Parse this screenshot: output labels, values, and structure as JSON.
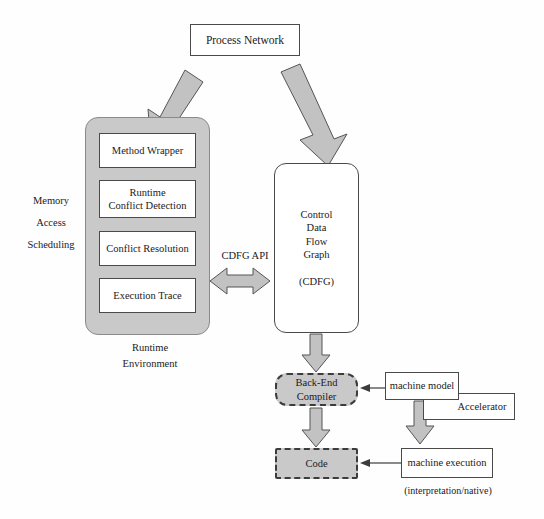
{
  "diagram": {
    "title_node": {
      "label": "Process Network"
    },
    "runtime": {
      "caption_line1": "Runtime",
      "caption_line2": "Environment",
      "side_labels": [
        "Memory",
        "Access",
        "Scheduling"
      ],
      "components": [
        {
          "label": "Method Wrapper"
        },
        {
          "label_line1": "Runtime",
          "label_line2": "Conflict Detection"
        },
        {
          "label": "Conflict Resolution"
        },
        {
          "label": "Execution Trace"
        }
      ]
    },
    "cdfg": {
      "lines": [
        "Control",
        "Data",
        "Flow",
        "Graph"
      ],
      "abbrev": "(CDFG)"
    },
    "api": {
      "label": "CDFG API"
    },
    "backend": {
      "label_line1": "Back-End",
      "label_line2": "Compiler"
    },
    "code": {
      "label": "Code"
    },
    "machine_model": {
      "label": "machine model"
    },
    "accelerator": {
      "label": "Accelerator"
    },
    "machine_execution": {
      "label": "machine execution",
      "note": "(interpretation/native)"
    }
  },
  "colors": {
    "gray_fill": "#c9c9c9",
    "arrow_fill": "#c2c2c2",
    "stroke": "#3c3c3c",
    "background": "#fefefe"
  }
}
